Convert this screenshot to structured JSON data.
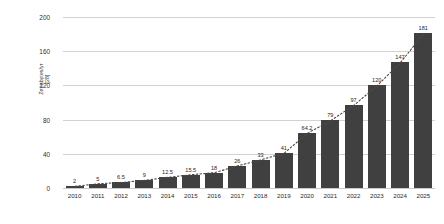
{
  "chart_data": {
    "type": "bar",
    "title": "",
    "xlabel": "",
    "ylabel": "Zettabytes/yr",
    "ylabel_citation": "[28]",
    "categories": [
      "2010",
      "2011",
      "2012",
      "2013",
      "2014",
      "2015",
      "2016",
      "2017",
      "2018",
      "2019",
      "2020",
      "2021",
      "2022",
      "2023",
      "2024",
      "2025"
    ],
    "values": [
      2,
      5,
      6.5,
      9,
      12.5,
      15.5,
      18,
      26,
      33,
      41,
      64.2,
      79,
      97,
      120,
      147,
      181
    ],
    "value_labels": [
      "2",
      "5",
      "6.5",
      "9",
      "12.5",
      "15.5",
      "18",
      "26",
      "33",
      "41",
      "64.2",
      "79",
      "97",
      "120",
      "147",
      "181"
    ],
    "ylim": [
      0,
      200
    ],
    "yticks": [
      0,
      40,
      80,
      120,
      160,
      200
    ],
    "ytick_labels": [
      "0",
      "40",
      "80",
      "120",
      "160",
      "200"
    ],
    "grid": true,
    "legend": "none",
    "series": [
      {
        "name": "Global data volume",
        "values": [
          2,
          5,
          6.5,
          9,
          12.5,
          15.5,
          18,
          26,
          33,
          41,
          64.2,
          79,
          97,
          120,
          147,
          181
        ]
      }
    ],
    "overlays": [
      {
        "type": "line",
        "style": "dotted",
        "name": "trend-line",
        "color": "#4a4a4a"
      }
    ],
    "colors": {
      "bar": "#404040",
      "gridline": "#d2d2d2",
      "text": "#2b2b2b",
      "background": "#ffffff",
      "trend": "#4a4a4a"
    }
  }
}
